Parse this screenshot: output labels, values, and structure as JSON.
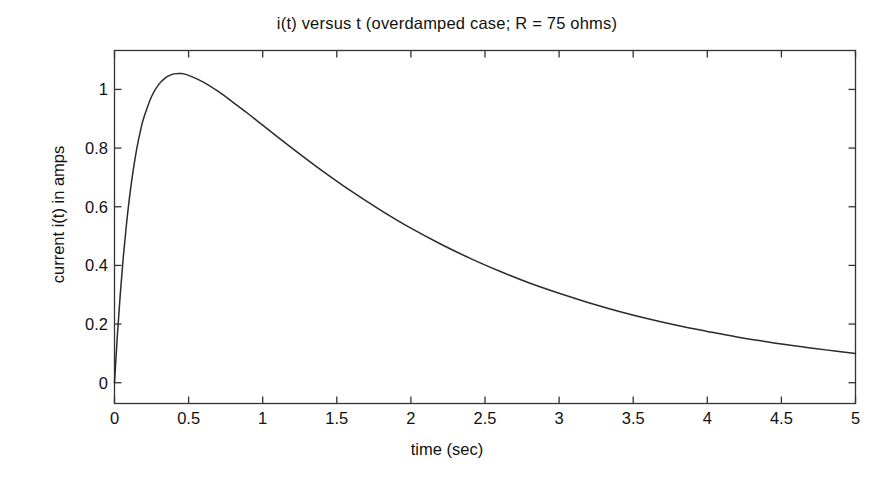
{
  "chart_data": {
    "type": "line",
    "title": "i(t) versus t (overdamped case; R = 75 ohms)",
    "xlabel": "time (sec)",
    "ylabel": "current i(t) in amps",
    "xlim": [
      0,
      5
    ],
    "ylim": [
      -0.0708,
      1.1327
    ],
    "xticks": [
      "0",
      "0.5",
      "1",
      "1.5",
      "2",
      "2.5",
      "3",
      "3.5",
      "4",
      "4.5",
      "5"
    ],
    "xtick_values": [
      0,
      0.5,
      1,
      1.5,
      2,
      2.5,
      3,
      3.5,
      4,
      4.5,
      5
    ],
    "yticks": [
      "0",
      "0.2",
      "0.4",
      "0.6",
      "0.8",
      "1"
    ],
    "ytick_values": [
      0,
      0.2,
      0.4,
      0.6,
      0.8,
      1
    ],
    "grid": false,
    "legend": null,
    "series": [
      {
        "name": "i(t)",
        "color": "#2b2b2b",
        "x": [
          0,
          0.02,
          0.04,
          0.06,
          0.08,
          0.1,
          0.12,
          0.15,
          0.18,
          0.2,
          0.25,
          0.3,
          0.35,
          0.37,
          0.4,
          0.45,
          0.5,
          0.6,
          0.7,
          0.8,
          0.9,
          1,
          1.2,
          1.4,
          1.6,
          1.8,
          2,
          2.2,
          2.4,
          2.6,
          2.8,
          3,
          3.2,
          3.4,
          3.6,
          3.8,
          4,
          4.2,
          4.4,
          4.6,
          4.8,
          5
        ],
        "y": [
          0,
          0.166,
          0.309,
          0.432,
          0.537,
          0.627,
          0.703,
          0.797,
          0.87,
          0.907,
          0.976,
          1.018,
          1.042,
          1.047,
          1.053,
          1.054,
          1.048,
          1.025,
          0.993,
          0.956,
          0.918,
          0.878,
          0.799,
          0.723,
          0.652,
          0.587,
          0.527,
          0.473,
          0.424,
          0.38,
          0.34,
          0.305,
          0.273,
          0.244,
          0.218,
          0.195,
          0.175,
          0.156,
          0.14,
          0.125,
          0.112,
          0.1
        ]
      }
    ],
    "annotations": {
      "peak_value": "1.054",
      "peak_time": "0.45",
      "end_value": "0.10"
    }
  },
  "axes": {
    "box_color": "#333333",
    "line_width": "1.3",
    "tick_direction": "in"
  }
}
